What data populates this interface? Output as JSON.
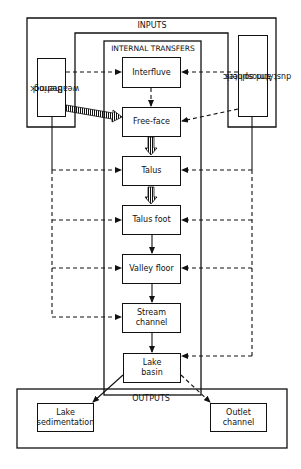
{
  "diagram": {
    "groups": {
      "inputs": "INPUTS",
      "internal_transfers": "INTERNAL TRANSFERS",
      "outputs": "OUTPUTS"
    },
    "inputs": {
      "bedrock": [
        "Bedrock",
        "weathering"
      ],
      "atmospheric": [
        "Atmospheric",
        "dust and solutes"
      ]
    },
    "internal_nodes": [
      {
        "id": "interfluve",
        "lines": [
          "Interfluve"
        ]
      },
      {
        "id": "free-face",
        "lines": [
          "Free-face"
        ]
      },
      {
        "id": "talus",
        "lines": [
          "Talus"
        ]
      },
      {
        "id": "talus-foot",
        "lines": [
          "Talus foot"
        ]
      },
      {
        "id": "valley-floor",
        "lines": [
          "Valley floor"
        ]
      },
      {
        "id": "stream-channel",
        "lines": [
          "Stream",
          "channel"
        ]
      },
      {
        "id": "lake-basin",
        "lines": [
          "Lake",
          "basin"
        ]
      }
    ],
    "outputs": {
      "lake_sedimentation": [
        "Lake",
        "sedimentation"
      ],
      "outlet_channel": [
        "Outlet",
        "channel"
      ]
    },
    "edges": [
      {
        "from": "Bedrock weathering",
        "to": "Interfluve",
        "style": "dashed"
      },
      {
        "from": "Atmospheric dust and solutes",
        "to": "Interfluve",
        "style": "dashed"
      },
      {
        "from": "Bedrock weathering",
        "to": "Free-face",
        "style": "hatched"
      },
      {
        "from": "Atmospheric dust and solutes",
        "to": "Free-face",
        "style": "dashed"
      },
      {
        "from": "Interfluve",
        "to": "Free-face",
        "style": "dashed"
      },
      {
        "from": "Free-face",
        "to": "Talus",
        "style": "hatched"
      },
      {
        "from": "Talus",
        "to": "Talus foot",
        "style": "hatched"
      },
      {
        "from": "Talus foot",
        "to": "Valley floor",
        "style": "solid"
      },
      {
        "from": "Valley floor",
        "to": "Stream channel",
        "style": "solid"
      },
      {
        "from": "Stream channel",
        "to": "Lake basin",
        "style": "solid"
      },
      {
        "from": "Bedrock weathering",
        "to": "Talus",
        "style": "dashed"
      },
      {
        "from": "Bedrock weathering",
        "to": "Talus foot",
        "style": "dashed"
      },
      {
        "from": "Bedrock weathering",
        "to": "Valley floor",
        "style": "dashed"
      },
      {
        "from": "Bedrock weathering",
        "to": "Stream channel",
        "style": "dashed"
      },
      {
        "from": "Atmospheric dust and solutes",
        "to": "Talus",
        "style": "dashed"
      },
      {
        "from": "Atmospheric dust and solutes",
        "to": "Talus foot",
        "style": "dashed"
      },
      {
        "from": "Atmospheric dust and solutes",
        "to": "Valley floor",
        "style": "dashed"
      },
      {
        "from": "Atmospheric dust and solutes",
        "to": "Lake basin",
        "style": "dashed"
      },
      {
        "from": "Lake basin",
        "to": "Lake sedimentation",
        "style": "solid"
      },
      {
        "from": "Lake basin",
        "to": "Outlet channel",
        "style": "dashed"
      }
    ],
    "colors": {
      "line": "#111111",
      "background": "#ffffff"
    }
  }
}
